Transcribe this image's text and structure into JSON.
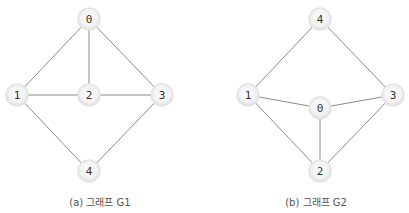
{
  "graphs": [
    {
      "id": "G1",
      "caption": "(a) 그래프 G1",
      "caption_pos": [
        100,
        201
      ],
      "nodes": [
        {
          "id": "0",
          "label": "0",
          "x": 89,
          "y": 19
        },
        {
          "id": "1",
          "label": "1",
          "x": 17,
          "y": 95
        },
        {
          "id": "2",
          "label": "2",
          "x": 89,
          "y": 95
        },
        {
          "id": "3",
          "label": "3",
          "x": 162,
          "y": 95
        },
        {
          "id": "4",
          "label": "4",
          "x": 89,
          "y": 171
        }
      ],
      "edges": [
        [
          "0",
          "1"
        ],
        [
          "0",
          "2"
        ],
        [
          "0",
          "3"
        ],
        [
          "1",
          "2"
        ],
        [
          "2",
          "3"
        ],
        [
          "1",
          "4"
        ],
        [
          "3",
          "4"
        ]
      ]
    },
    {
      "id": "G2",
      "caption": "(b) 그래프 G2",
      "caption_pos": [
        316,
        201
      ],
      "nodes": [
        {
          "id": "4",
          "label": "4",
          "x": 320,
          "y": 19
        },
        {
          "id": "1",
          "label": "1",
          "x": 248,
          "y": 95
        },
        {
          "id": "0",
          "label": "0",
          "x": 320,
          "y": 108
        },
        {
          "id": "3",
          "label": "3",
          "x": 393,
          "y": 95
        },
        {
          "id": "2",
          "label": "2",
          "x": 320,
          "y": 171
        }
      ],
      "edges": [
        [
          "4",
          "1"
        ],
        [
          "4",
          "3"
        ],
        [
          "1",
          "0"
        ],
        [
          "0",
          "3"
        ],
        [
          "0",
          "2"
        ],
        [
          "1",
          "2"
        ],
        [
          "3",
          "2"
        ]
      ]
    }
  ],
  "colors": {
    "edge": "#8a8a8a",
    "node_fill": "#f0f0f0",
    "node_stroke": "#e4e4e4",
    "label": "#333333"
  }
}
